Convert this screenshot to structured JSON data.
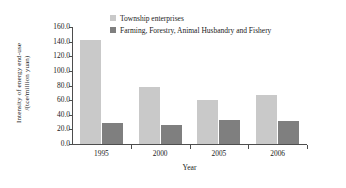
{
  "chart_data": {
    "type": "bar",
    "title": "",
    "xlabel": "Year",
    "ylabel": "Intensity of energy end-use /(tce/million yuan)",
    "ylabel_line1": "Intensity of energy end-use",
    "ylabel_line2": "/(tce/million yuan)",
    "categories": [
      "1995",
      "2000",
      "2005",
      "2006"
    ],
    "series": [
      {
        "name": "Township enterprises",
        "color": "#c9c9c9",
        "values": [
          142.0,
          78.0,
          60.0,
          67.5
        ]
      },
      {
        "name": "Farming, Forestry, Animal Husbandry and Fishery",
        "color": "#7f7f7f",
        "values": [
          29.0,
          26.5,
          32.5,
          31.5
        ]
      }
    ],
    "ylim": [
      0.0,
      160.0
    ],
    "ytick_step": 20.0,
    "yticks": [
      "160.0",
      "140.0",
      "120.0",
      "100.0",
      "80.0",
      "60.0",
      "40.0",
      "20.0",
      "0.0"
    ],
    "grid": false,
    "legend_position": "top-center"
  },
  "axis": {
    "axis_color": "#4d4d4d"
  }
}
